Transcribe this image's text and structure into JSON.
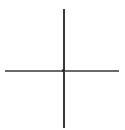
{
  "figure": {
    "name": "crosshair-axes",
    "width": 125,
    "height": 130,
    "background_color": "#ffffff"
  },
  "chart_data": {
    "type": "line",
    "title": "",
    "subtitle": "",
    "xlabel": "",
    "ylabel": "",
    "grid": false,
    "legend": null,
    "tick_labels": {
      "x": [],
      "y": []
    },
    "annotations": [],
    "series": [
      {
        "name": "vertical-axis",
        "orientation": "vertical",
        "color": "#3a3a3a",
        "thickness_px": 1.5,
        "x": [
          63,
          63
        ],
        "y": [
          9,
          128
        ]
      },
      {
        "name": "horizontal-axis",
        "orientation": "horizontal",
        "color": "#6a6a6a",
        "thickness_px": 1.5,
        "x": [
          5,
          119
        ],
        "y": [
          70,
          70
        ]
      }
    ],
    "intersection": {
      "x": 63,
      "y": 70,
      "color": "#2b2b2b"
    },
    "xlim": [
      0,
      125
    ],
    "ylim": [
      0,
      130
    ]
  },
  "styles": {
    "vertical": {
      "left": "63px",
      "top": "9px",
      "height": "119px",
      "color": "#3a3a3a"
    },
    "horizontal": {
      "left": "5px",
      "top": "70px",
      "width": "114px",
      "color": "#6a6a6a"
    },
    "point": {
      "left": "62px",
      "top": "69px"
    }
  }
}
